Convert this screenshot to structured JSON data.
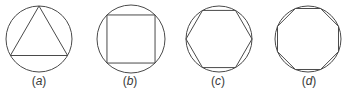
{
  "figure": {
    "stroke_color": "#4a4a4a",
    "panels": [
      {
        "id": "a",
        "label_letter": "a",
        "shape": "circle with inscribed equilateral triangle",
        "sides": 3,
        "cx": 39,
        "cy": 39,
        "r": 33,
        "rotation_deg": -90
      },
      {
        "id": "b",
        "label_letter": "b",
        "shape": "circle with inscribed square",
        "sides": 4,
        "cx": 131,
        "cy": 39,
        "r": 34,
        "rotation_deg": -45
      },
      {
        "id": "c",
        "label_letter": "c",
        "shape": "circle with inscribed regular hexagon",
        "sides": 6,
        "cx": 219,
        "cy": 39,
        "r": 33,
        "rotation_deg": 0
      },
      {
        "id": "d",
        "label_letter": "d",
        "shape": "circle with inscribed regular octagon",
        "sides": 8,
        "cx": 308,
        "cy": 39,
        "r": 33,
        "rotation_deg": 22.5
      }
    ]
  }
}
